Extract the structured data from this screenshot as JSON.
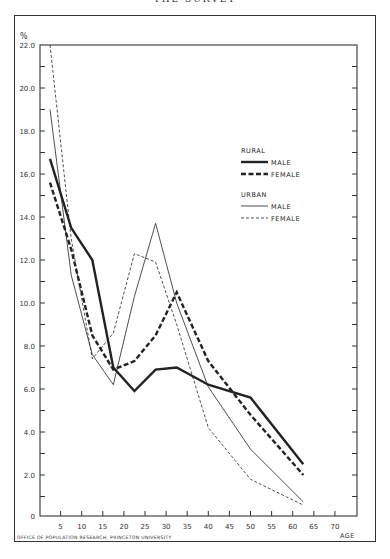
{
  "header": {
    "title": "THE SURVEY"
  },
  "footer": {
    "credit": "OFFICE OF POPULATION RESEARCH, PRINCETON UNIVERSITY"
  },
  "chart_data": {
    "type": "line",
    "title": "",
    "xlabel": "AGE",
    "ylabel": "%",
    "xlim": [
      0,
      75
    ],
    "ylim": [
      0,
      22
    ],
    "x_ticks": [
      5,
      10,
      15,
      20,
      25,
      30,
      35,
      40,
      45,
      50,
      55,
      60,
      65,
      70
    ],
    "y_ticks": [
      "0",
      "2.0",
      "4.0",
      "6.0",
      "8.0",
      "10.0",
      "12.0",
      "14.0",
      "16.0",
      "18.0",
      "20.0",
      "22.0"
    ],
    "grid": false,
    "legend": {
      "groups": [
        {
          "label": "RURAL",
          "items": [
            {
              "label": "MALE",
              "style": "thick-solid"
            },
            {
              "label": "FEMALE",
              "style": "thick-dashed"
            }
          ]
        },
        {
          "label": "URBAN",
          "items": [
            {
              "label": "MALE",
              "style": "thin-solid"
            },
            {
              "label": "FEMALE",
              "style": "thin-dashed"
            }
          ]
        }
      ],
      "position": "upper-right"
    },
    "x": [
      2.5,
      7.5,
      12.5,
      17.5,
      22.5,
      27.5,
      32.5,
      40,
      50,
      62.5
    ],
    "series": [
      {
        "name": "Rural Male",
        "style": "thick-solid",
        "values": [
          16.7,
          13.5,
          12.0,
          7.0,
          5.9,
          6.9,
          7.0,
          6.2,
          5.6,
          2.5
        ]
      },
      {
        "name": "Rural Female",
        "style": "thick-dashed",
        "values": [
          15.6,
          12.5,
          8.5,
          6.9,
          7.3,
          8.5,
          10.5,
          7.3,
          4.8,
          2.0
        ]
      },
      {
        "name": "Urban Male",
        "style": "thin-solid",
        "values": [
          19.0,
          11.3,
          7.6,
          6.2,
          10.3,
          13.7,
          10.0,
          6.1,
          3.2,
          0.75
        ]
      },
      {
        "name": "Urban Female",
        "style": "thin-dashed",
        "values": [
          22.0,
          13.0,
          7.4,
          8.6,
          12.3,
          11.9,
          9.0,
          4.2,
          1.8,
          0.6
        ]
      }
    ]
  }
}
